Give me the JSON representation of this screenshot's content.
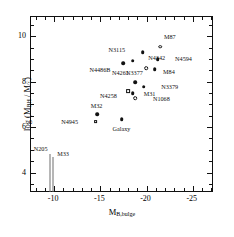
{
  "figure": {
    "title": "",
    "background": "#ffffff",
    "frame_color": "#111111"
  },
  "axes": {
    "x": {
      "label": "M",
      "label_sub": "B,bulge",
      "ticks": [
        "-10",
        "-15",
        "-20",
        "-25"
      ],
      "tick_values": [
        -10,
        -15,
        -20,
        -25
      ],
      "range": [
        -7.5,
        -27.3
      ],
      "minor_ticks": true,
      "direction": "inverted"
    },
    "y": {
      "label_prefix": "log (M",
      "label_sub1": "BH",
      "label_mid": " / M",
      "label_sub2": "☉",
      "label_suffix": ")",
      "ticks": [
        "4",
        "6",
        "8",
        "10"
      ],
      "tick_values": [
        4,
        6,
        8,
        10
      ],
      "range": [
        3.1,
        10.85
      ],
      "minor_ticks": true
    }
  },
  "chart_data": {
    "type": "scatter",
    "title": "",
    "xlabel": "M_B,bulge",
    "ylabel": "log ( M_BH / M_sun )",
    "xlim": [
      -7.5,
      -27.3
    ],
    "ylim": [
      3.1,
      10.85
    ],
    "grid": false,
    "legend": "none",
    "marker_types": {
      "filled-circle": "secure / stellar-dynamical detection",
      "open-circle": "alternate determination",
      "open-square": "maser or gas-disk determination",
      "vertical-line": "upper limit"
    },
    "points": [
      {
        "name": "M87",
        "x": -21.6,
        "y": 9.5,
        "marker": "open-circle",
        "label_dx": -0.4,
        "label_dy": 0.42
      },
      {
        "name": "N3115",
        "x": -19.7,
        "y": 9.25,
        "marker": "filled-circle",
        "label_dx": 1.9,
        "label_dy": 0.1
      },
      {
        "name": "N4594",
        "x": -21.3,
        "y": 8.95,
        "marker": "filled-circle",
        "label_dx": -1.9,
        "label_dy": 0.02
      },
      {
        "name": "N4342",
        "x": -18.6,
        "y": 8.88,
        "marker": "filled-circle",
        "label_dx": -1.7,
        "label_dy": 0.13
      },
      {
        "name": "N4486B",
        "x": -17.6,
        "y": 8.78,
        "marker": "filled-circle",
        "label_dx": 1.4,
        "label_dy": -0.29
      },
      {
        "name": "N4261",
        "x": -20.1,
        "y": 8.56,
        "marker": "open-circle",
        "label_dx": 1.9,
        "label_dy": -0.22
      },
      {
        "name": "M84",
        "x": -21.0,
        "y": 8.52,
        "marker": "filled-circle",
        "label_dx": -0.9,
        "label_dy": -0.12
      },
      {
        "name": "N3377",
        "x": -18.9,
        "y": 7.93,
        "marker": "filled-circle",
        "label_dx": 0.1,
        "label_dy": 0.4
      },
      {
        "name": "N3379",
        "x": -19.8,
        "y": 7.73,
        "marker": "filled-circle",
        "label_dx": -1.9,
        "label_dy": -0.02
      },
      {
        "name": "N4258",
        "x": -18.1,
        "y": 7.56,
        "marker": "open-square",
        "label_dx": 1.2,
        "label_dy": -0.22
      },
      {
        "name": "M31",
        "x": -18.6,
        "y": 7.45,
        "marker": "filled-circle",
        "label_dx": -1.2,
        "label_dy": -0.02
      },
      {
        "name": "N1068",
        "x": -18.9,
        "y": 7.22,
        "marker": "open-circle",
        "label_dx": -1.9,
        "label_dy": -0.01
      },
      {
        "name": "M32",
        "x": -14.8,
        "y": 6.52,
        "marker": "filled-circle",
        "label_dx": 0.1,
        "label_dy": 0.36
      },
      {
        "name": "Galaxy",
        "x": -17.4,
        "y": 6.3,
        "marker": "filled-circle",
        "label_dx": 0.0,
        "label_dy": -0.42
      },
      {
        "name": "N4945",
        "x": -14.6,
        "y": 6.2,
        "marker": "open-square",
        "label_dx": 1.9,
        "label_dy": 0.0
      }
    ],
    "upper_limits": [
      {
        "name": "N205",
        "x": -9.65,
        "y_top": 4.77,
        "y_bottom": 3.12,
        "label_dx": 0.25,
        "label_dy": 0.22
      },
      {
        "name": "M33",
        "x": -10.0,
        "y_top": 4.66,
        "y_bottom": 3.12,
        "label_dx": -0.45,
        "label_dy": 0.12
      }
    ]
  }
}
